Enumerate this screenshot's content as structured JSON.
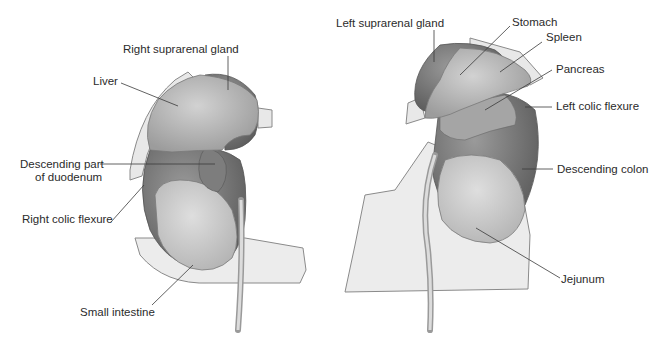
{
  "figure": {
    "left_view": {
      "labels": {
        "right_suprarenal_gland": "Right suprarenal gland",
        "liver": "Liver",
        "descending_duodenum_1": "Descending part",
        "descending_duodenum_2": "of duodenum",
        "right_colic_flexure": "Right colic flexure",
        "small_intestine": "Small intestine"
      }
    },
    "right_view": {
      "labels": {
        "left_suprarenal_gland": "Left suprarenal gland",
        "stomach": "Stomach",
        "spleen": "Spleen",
        "pancreas": "Pancreas",
        "left_colic_flexure": "Left colic flexure",
        "descending_colon": "Descending colon",
        "jejunum": "Jejunum"
      }
    },
    "colors": {
      "background": "#ffffff",
      "kidney_dark": "#6f6f6f",
      "organ_mid": "#a9a9a9",
      "organ_light": "#c9c9c9",
      "peritoneum": "#e6e6e6",
      "leader_line": "#3a3a3a"
    }
  }
}
